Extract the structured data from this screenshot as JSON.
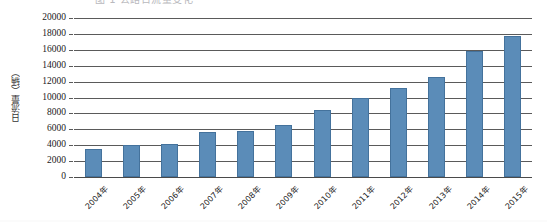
{
  "figure": {
    "clipped_title": "图 1  公路日流量变化",
    "y_axis_title": "日流量（辆）",
    "bar_color": "#5b8cb8",
    "bar_border_color": "#44729c",
    "grid_color": "#5a5a5a"
  },
  "chart_data": {
    "type": "bar",
    "title": "",
    "xlabel": "",
    "ylabel": "日流量（辆）",
    "ylim": [
      0,
      20000
    ],
    "ytick_step": 2000,
    "yticks": [
      0,
      2000,
      4000,
      6000,
      8000,
      10000,
      12000,
      14000,
      16000,
      18000,
      20000
    ],
    "ytick_labels": [
      "0",
      "2000",
      "4000",
      "6000",
      "8000",
      "10000",
      "12000",
      "14000",
      "16000",
      "18000",
      "20000"
    ],
    "grid": true,
    "legend": null,
    "categories": [
      "2004年",
      "2005年",
      "2006年",
      "2007年",
      "2008年",
      "2009年",
      "2010年",
      "2011年",
      "2012年",
      "2013年",
      "2014年",
      "2015年"
    ],
    "values": [
      3500,
      4000,
      4200,
      5600,
      5800,
      6600,
      8400,
      9900,
      11200,
      12600,
      15800,
      17800
    ]
  }
}
